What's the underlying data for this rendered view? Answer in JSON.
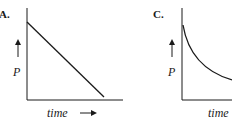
{
  "panels": [
    {
      "id": "A",
      "label": "A.",
      "y_label": "P",
      "x_label": "time",
      "curve": "linear-decrease",
      "description": "P decreases linearly with time"
    },
    {
      "id": "C",
      "label": "C.",
      "y_label": "P",
      "x_label": "time",
      "curve": "exponential-decay",
      "description": "P decays with decreasing slope over time"
    }
  ],
  "colors": {
    "ink": "#1a1a1a",
    "background": "#ffffff"
  }
}
